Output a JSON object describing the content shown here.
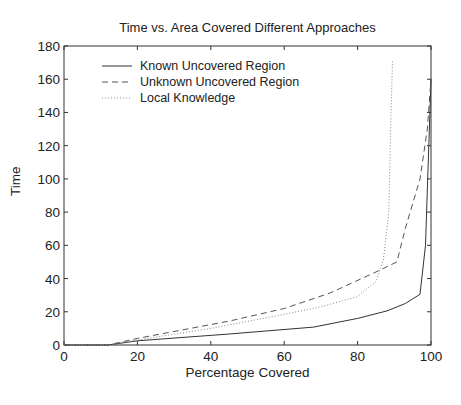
{
  "chart_data": {
    "type": "line",
    "title": "Time vs. Area Covered  Different Approaches",
    "xlabel": "Percentage Covered",
    "ylabel": "Time",
    "xlim": [
      0,
      100
    ],
    "ylim": [
      0,
      180
    ],
    "xticks": [
      0,
      20,
      40,
      60,
      80,
      100
    ],
    "yticks": [
      0,
      20,
      40,
      60,
      80,
      100,
      120,
      140,
      160,
      180
    ],
    "grid": false,
    "legend_position": "upper-left",
    "series": [
      {
        "name": "Known Uncovered Region",
        "style": "solid",
        "color": "#333333",
        "x": [
          0,
          12,
          20,
          45,
          68,
          80,
          88,
          93,
          97,
          98.5,
          100
        ],
        "y": [
          0,
          0,
          2.5,
          6.6,
          10.8,
          16,
          20.5,
          25,
          30.5,
          60,
          160
        ]
      },
      {
        "name": "Unknown Uncovered Region",
        "style": "dashed",
        "color": "#555555",
        "x": [
          0,
          12,
          20,
          45,
          60,
          72.5,
          86,
          90.7,
          93,
          95,
          97,
          99,
          100
        ],
        "y": [
          0,
          0,
          4,
          14.4,
          22,
          31.3,
          45,
          50,
          70,
          85,
          100,
          130,
          160
        ]
      },
      {
        "name": "Local Knowledge",
        "style": "dotted",
        "color": "#888888",
        "x": [
          0,
          12,
          20,
          40,
          59,
          70,
          79.8,
          85,
          87,
          88.5,
          89,
          89.5
        ],
        "y": [
          0,
          0,
          3,
          10,
          18,
          23,
          29,
          38,
          51,
          80,
          130,
          171
        ]
      }
    ]
  }
}
